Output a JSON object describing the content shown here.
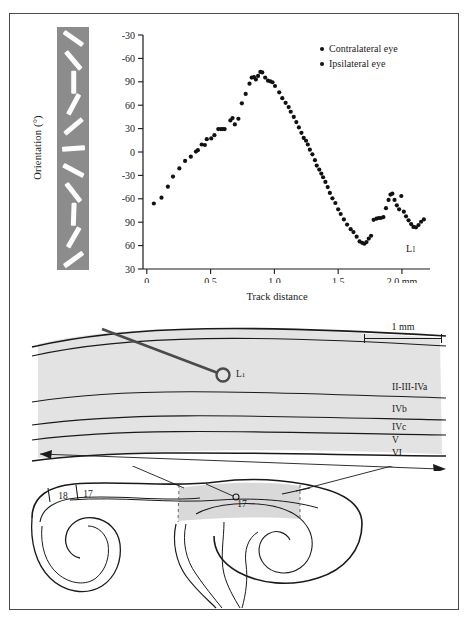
{
  "figure": {
    "border_color": "#4a4a4a"
  },
  "plot": {
    "y_axis_title": "Orientation (°)",
    "x_axis_title": "Track distance",
    "y_ticks": [
      "-30",
      "-60",
      "90",
      "60",
      "30",
      "0",
      "-30",
      "-60",
      "90",
      "60",
      "30"
    ],
    "x_ticks": [
      "0",
      "0.5",
      "1.0",
      "1.5",
      "2.0 mm"
    ],
    "x_tick_values": [
      0,
      0.5,
      1.0,
      1.5,
      2.0
    ],
    "x_range": [
      -0.03,
      2.22
    ],
    "track_end_label": "L",
    "track_end_sub": "1",
    "legend": [
      {
        "label": "Contralateral eye",
        "color": "#111111",
        "marker": "filled-circle"
      },
      {
        "label": "Ipsilateral eye",
        "color": "#111111",
        "marker": "filled-circle"
      }
    ],
    "orientation_strip": {
      "background": "#8c8c8c",
      "bar_color": "#fdfdfd",
      "angles": [
        -35,
        -50,
        90,
        62,
        40,
        4,
        -28,
        -52,
        88,
        60,
        36
      ]
    }
  },
  "chart_data": {
    "type": "scatter",
    "title": "",
    "xlabel": "Track distance",
    "ylabel": "Orientation (°)",
    "xlim": [
      -0.03,
      2.22
    ],
    "ylim": [
      0,
      10
    ],
    "grid": false,
    "legend_position": "top-right",
    "y_tick_labels": [
      "-30",
      "-60",
      "90",
      "60",
      "30",
      "0",
      "-30",
      "-60",
      "90",
      "60",
      "30"
    ],
    "y_tick_positions": [
      10,
      9,
      8,
      7,
      6,
      5,
      4,
      3,
      2,
      1,
      0
    ],
    "x_tick_labels": [
      "0",
      "0.5",
      "1.0",
      "1.5",
      "2.0 mm"
    ],
    "series": [
      {
        "name": "Contralateral eye",
        "color": "#111111",
        "points": [
          [
            0.055,
            2.8
          ],
          [
            0.115,
            3.05
          ],
          [
            0.165,
            3.52
          ],
          [
            0.205,
            3.95
          ],
          [
            0.255,
            4.3
          ],
          [
            0.3,
            4.62
          ],
          [
            0.345,
            4.8
          ],
          [
            0.385,
            5.02
          ],
          [
            0.4,
            5.08
          ],
          [
            0.43,
            5.32
          ],
          [
            0.455,
            5.3
          ],
          [
            0.47,
            5.55
          ],
          [
            0.505,
            5.58
          ],
          [
            0.53,
            5.72
          ],
          [
            0.56,
            5.98
          ],
          [
            0.58,
            5.98
          ],
          [
            0.595,
            5.98
          ],
          [
            0.61,
            5.98
          ],
          [
            0.655,
            6.35
          ],
          [
            0.672,
            6.45
          ],
          [
            0.69,
            6.18
          ],
          [
            0.718,
            6.42
          ],
          [
            0.745,
            7.08
          ],
          [
            0.775,
            7.48
          ],
          [
            0.805,
            7.92
          ],
          [
            0.822,
            8.18
          ],
          [
            0.84,
            8.2
          ],
          [
            0.855,
            8.1
          ],
          [
            0.872,
            8.25
          ],
          [
            0.89,
            8.42
          ],
          [
            0.905,
            8.4
          ],
          [
            0.928,
            8.18
          ],
          [
            0.95,
            8.05
          ],
          [
            0.968,
            8.02
          ],
          [
            0.985,
            7.98
          ],
          [
            1.005,
            7.82
          ],
          [
            1.038,
            7.55
          ],
          [
            1.062,
            7.3
          ],
          [
            1.088,
            7.1
          ],
          [
            1.112,
            6.92
          ],
          [
            1.128,
            6.72
          ],
          [
            1.152,
            6.5
          ],
          [
            1.172,
            6.28
          ],
          [
            1.192,
            6.05
          ],
          [
            1.212,
            5.82
          ],
          [
            1.23,
            5.6
          ],
          [
            1.248,
            5.48
          ],
          [
            1.262,
            5.32
          ],
          [
            1.278,
            5.1
          ],
          [
            1.298,
            4.9
          ],
          [
            1.318,
            4.65
          ],
          [
            1.332,
            4.42
          ],
          [
            1.352,
            4.25
          ],
          [
            1.368,
            4.08
          ],
          [
            1.382,
            3.92
          ],
          [
            1.4,
            3.72
          ],
          [
            1.418,
            3.5
          ],
          [
            1.435,
            3.25
          ],
          [
            1.455,
            3.02
          ],
          [
            1.478,
            2.82
          ],
          [
            1.5,
            2.55
          ],
          [
            1.52,
            2.35
          ],
          [
            1.545,
            2.12
          ],
          [
            1.57,
            1.9
          ],
          [
            1.598,
            1.7
          ],
          [
            1.62,
            1.58
          ],
          [
            1.645,
            1.38
          ],
          [
            1.668,
            1.18
          ],
          [
            1.688,
            1.12
          ],
          [
            1.705,
            1.08
          ],
          [
            1.722,
            1.15
          ],
          [
            1.74,
            1.3
          ],
          [
            1.758,
            1.42
          ],
          [
            1.778,
            2.1
          ],
          [
            1.8,
            2.15
          ],
          [
            1.818,
            2.18
          ],
          [
            1.835,
            2.18
          ],
          [
            1.855,
            2.22
          ],
          [
            1.875,
            2.6
          ],
          [
            1.895,
            2.95
          ],
          [
            1.91,
            3.18
          ],
          [
            1.925,
            3.22
          ],
          [
            1.942,
            2.95
          ],
          [
            1.96,
            2.72
          ],
          [
            1.978,
            2.55
          ],
          [
            1.995,
            3.12
          ],
          [
            2.015,
            2.45
          ],
          [
            2.032,
            2.25
          ],
          [
            2.052,
            2.08
          ],
          [
            2.072,
            1.92
          ],
          [
            2.09,
            1.8
          ],
          [
            2.11,
            1.78
          ],
          [
            2.13,
            1.88
          ],
          [
            2.15,
            2.02
          ],
          [
            2.172,
            2.12
          ]
        ]
      }
    ]
  },
  "cortex": {
    "scale_bar_label": "1 mm",
    "track_label": "L",
    "track_label_sub": "1",
    "layers": [
      "II-III-IVa",
      "IVb",
      "IVc",
      "V",
      "VI"
    ],
    "shade_color": "#e0e0e0"
  },
  "brain": {
    "area_labels": [
      "18",
      "17",
      "17"
    ],
    "shade_color": "#d9d9d9"
  }
}
